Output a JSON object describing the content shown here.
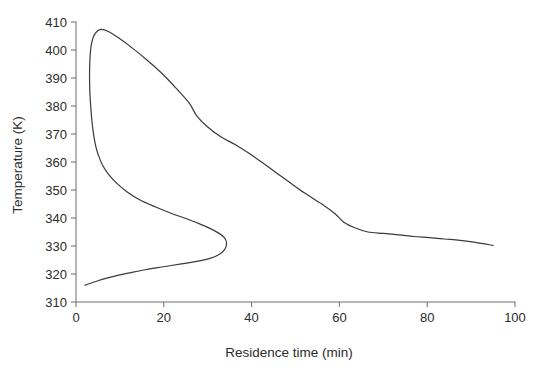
{
  "chart_data": {
    "type": "line",
    "title": "",
    "xlabel": "Residence time (min)",
    "ylabel": "Temperature (K)",
    "xlim": [
      0,
      100
    ],
    "ylim": [
      310,
      410
    ],
    "xticks": [
      0,
      20,
      40,
      60,
      80,
      100
    ],
    "yticks": [
      310,
      320,
      330,
      340,
      350,
      360,
      370,
      380,
      390,
      400,
      410
    ],
    "xtick_labels": [
      "0",
      "20",
      "40",
      "60",
      "80",
      "100"
    ],
    "ytick_labels": [
      "310",
      "320",
      "330",
      "340",
      "350",
      "360",
      "370",
      "380",
      "390",
      "400",
      "410"
    ],
    "grid": false,
    "legend": "none",
    "line_color": "#3a3a3a",
    "line_width": 1.2,
    "background": "#ffffff",
    "text_color": "#2b2b2b",
    "series": [
      {
        "name": "steady-state temperature locus",
        "description": "S-shaped multiplicity curve traced from the low-temperature ignition branch, around the turning point, up the unstable branch to the peak, then down the high-conversion branch",
        "x": [
          2.0,
          3.5,
          5.0,
          7.0,
          9.5,
          12.5,
          16.0,
          20.0,
          24.0,
          27.5,
          30.5,
          32.5,
          33.8,
          34.3,
          33.8,
          32.5,
          30.5,
          28.0,
          25.0,
          21.5,
          18.0,
          14.5,
          11.5,
          9.0,
          7.2,
          6.0,
          5.2,
          4.6,
          4.2,
          3.9,
          3.6,
          3.4,
          3.2,
          3.1,
          3.1,
          3.2,
          3.5,
          4.2,
          5.5,
          7.5,
          10.0,
          13.0,
          16.5,
          20.0,
          23.0,
          25.8,
          27.5,
          30.0,
          33.0,
          36.5,
          40.0,
          44.0,
          48.0,
          52.0,
          56.0,
          59.0,
          61.0,
          63.5,
          66.5,
          70.0,
          73.5,
          77.0,
          80.5,
          84.0,
          87.5,
          91.0,
          95.0
        ],
        "y": [
          316.0,
          316.8,
          317.6,
          318.5,
          319.5,
          320.5,
          321.6,
          322.6,
          323.6,
          324.5,
          325.6,
          326.9,
          328.6,
          331.0,
          333.0,
          334.6,
          336.3,
          338.0,
          339.8,
          341.8,
          344.0,
          346.5,
          349.5,
          352.8,
          356.0,
          359.0,
          362.0,
          365.0,
          368.0,
          371.0,
          375.0,
          379.0,
          383.5,
          388.5,
          393.0,
          397.5,
          402.0,
          405.5,
          407.3,
          406.5,
          404.0,
          400.5,
          396.0,
          391.0,
          386.0,
          381.0,
          376.5,
          372.5,
          369.0,
          366.0,
          362.5,
          358.0,
          353.5,
          349.0,
          345.0,
          341.5,
          338.5,
          336.5,
          335.0,
          334.5,
          334.0,
          333.4,
          333.0,
          332.5,
          332.0,
          331.3,
          330.2
        ]
      }
    ],
    "annotations": {
      "peak_temperature_k": 407.3,
      "peak_residence_time_min": 5.5,
      "turning_point_temperature_k": 331.0,
      "turning_point_residence_time_min": 34.3,
      "start_temperature_k": 316.0,
      "end_temperature_k": 330.2,
      "end_residence_time_min": 95.0
    }
  }
}
